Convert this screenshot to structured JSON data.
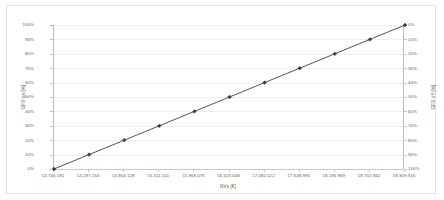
{
  "chart_data": {
    "type": "line",
    "title": "",
    "xlabel": "NVs [€]",
    "ylabel": "GFS on [%]",
    "y2label": "GFS off [%]",
    "grid": true,
    "legend": "none",
    "x": [
      3740181,
      4297154,
      4854128,
      5411101,
      5968075,
      6525048,
      7082022,
      7638995,
      8195969,
      8752942,
      9309916
    ],
    "xticklabels": [
      "€3.740.181",
      "€4.297.154",
      "€4.854.128",
      "€5.411.101",
      "€5.968.075",
      "€6.525.048",
      "€7.082.022",
      "€7.638.995",
      "€8.195.969",
      "€8.752.942",
      "€9.309.916"
    ],
    "series": [
      {
        "name": "GFS on",
        "values": [
          0,
          10,
          20,
          30,
          40,
          50,
          60,
          70,
          80,
          90,
          100
        ],
        "marker": "diamond",
        "color": "#404040"
      }
    ],
    "ylim": [
      0,
      100
    ],
    "yticklabels": [
      "0%",
      "10%",
      "20%",
      "30%",
      "40%",
      "50%",
      "60%",
      "70%",
      "80%",
      "90%",
      "100%"
    ],
    "y2lim": [
      100,
      0
    ],
    "y2ticklabels": [
      "0%",
      "10%",
      "20%",
      "30%",
      "40%",
      "50%",
      "60%",
      "70%",
      "80%",
      "90%",
      "100%"
    ]
  },
  "style": {
    "line_color": "#404040",
    "marker_color": "#3a3a3a",
    "grid_color": "#ededed",
    "axis_color": "#bdbdbd",
    "text_color": "#5a5a5a",
    "frame_color": "#e2e2e2",
    "background": "#ffffff"
  }
}
